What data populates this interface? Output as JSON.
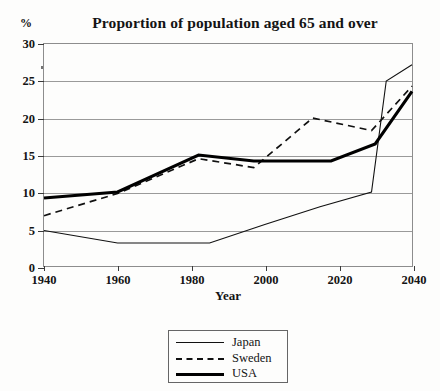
{
  "chart_data": {
    "type": "line",
    "title": "Proportion of population aged 65 and over",
    "xlabel": "Year",
    "ylabel": "%",
    "xlim": [
      1940,
      2040
    ],
    "ylim": [
      0,
      30
    ],
    "xticks": [
      1940,
      1960,
      1980,
      2000,
      2020,
      2040
    ],
    "yticks": [
      0,
      5,
      10,
      15,
      20,
      25,
      30
    ],
    "grid": true,
    "legend_position": "below-center",
    "series": [
      {
        "name": "Japan",
        "style": "thin-solid",
        "color": "#111111",
        "points": [
          [
            1940,
            4.8
          ],
          [
            1960,
            3.1
          ],
          [
            1985,
            3.1
          ],
          [
            2000,
            5.6
          ],
          [
            2015,
            8.0
          ],
          [
            2029,
            10.0
          ],
          [
            2033,
            25.0
          ],
          [
            2040,
            27.2
          ]
        ]
      },
      {
        "name": "Sweden",
        "style": "dashed",
        "color": "#111111",
        "points": [
          [
            1940,
            6.8
          ],
          [
            1960,
            9.8
          ],
          [
            1982,
            14.5
          ],
          [
            1997,
            13.3
          ],
          [
            2013,
            20.0
          ],
          [
            2029,
            18.3
          ],
          [
            2040,
            24.3
          ]
        ]
      },
      {
        "name": "USA",
        "style": "thick-solid",
        "color": "#000000",
        "points": [
          [
            1940,
            9.2
          ],
          [
            1960,
            10.0
          ],
          [
            1982,
            15.0
          ],
          [
            1997,
            14.2
          ],
          [
            2018,
            14.2
          ],
          [
            2030,
            16.5
          ],
          [
            2040,
            23.6
          ]
        ]
      }
    ]
  },
  "legend": {
    "items": [
      {
        "label": "Japan",
        "swatch": "thin-solid-line-swatch"
      },
      {
        "label": "Sweden",
        "swatch": "dashed-line-swatch"
      },
      {
        "label": "USA",
        "swatch": "thick-solid-line-swatch"
      }
    ]
  },
  "colors": {
    "background": "#fdfdfc",
    "gridline": "#9a9a9a",
    "frame": "#8d8d8d",
    "text": "#141414"
  }
}
